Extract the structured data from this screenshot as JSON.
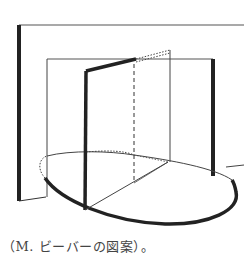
{
  "figure": {
    "stroke_color": "#222222",
    "background": "#ffffff"
  },
  "caption": {
    "text": "（M. ビーバーの図案）。"
  }
}
